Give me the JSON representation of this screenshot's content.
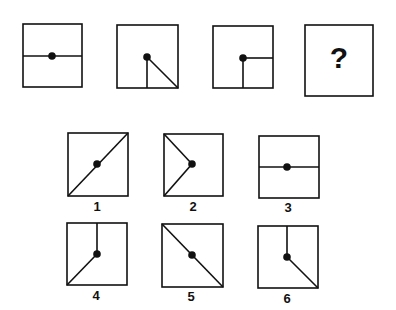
{
  "puzzle": {
    "sequence": [
      {
        "id": "seq-1",
        "lines": [
          "left",
          "right"
        ]
      },
      {
        "id": "seq-2",
        "lines": [
          "down",
          "bottom-right"
        ]
      },
      {
        "id": "seq-3",
        "lines": [
          "down",
          "right"
        ]
      },
      {
        "id": "seq-4",
        "question_mark": "?"
      }
    ],
    "options": [
      {
        "label": "1",
        "lines": [
          "top-right",
          "bottom-left"
        ]
      },
      {
        "label": "2",
        "lines": [
          "top-left",
          "bottom-left"
        ]
      },
      {
        "label": "3",
        "lines": [
          "left",
          "right"
        ]
      },
      {
        "label": "4",
        "lines": [
          "up",
          "bottom-left"
        ]
      },
      {
        "label": "5",
        "lines": [
          "top-left",
          "bottom-right"
        ]
      },
      {
        "label": "6",
        "lines": [
          "up",
          "bottom-right"
        ]
      }
    ]
  },
  "colors": {
    "stroke": "#111111",
    "background": "#ffffff"
  }
}
